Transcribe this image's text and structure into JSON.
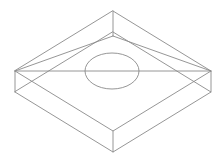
{
  "figure": {
    "background_color": "#ffffff",
    "line_color": "#8a8a8a",
    "line_width": 0.9,
    "canvas": {
      "width": 223,
      "height": 162
    }
  },
  "geometry": {
    "description": "Rectangular plate drawn in isometric projection, wireframe with hidden edges visible, circular hole centered on top face",
    "vertices_top_face": {
      "back": {
        "x": 113,
        "y": 11
      },
      "left": {
        "x": 15,
        "y": 71
      },
      "right": {
        "x": 211,
        "y": 71
      },
      "front": {
        "x": 113,
        "y": 131
      }
    },
    "vertices_bottom_face": {
      "back": {
        "x": 113,
        "y": 32
      },
      "left": {
        "x": 15,
        "y": 92
      },
      "right": {
        "x": 211,
        "y": 92
      },
      "front": {
        "x": 113,
        "y": 152
      }
    },
    "inner_back_vertex": {
      "x": 113,
      "y": 36
    },
    "thickness_px": 21,
    "hole": {
      "center": {
        "x": 112,
        "y": 71
      },
      "radius_x": 27,
      "radius_y": 18
    }
  },
  "edges": {
    "top_face_outline": "113,11 211,71 113,131 15,71 Z",
    "bottom_face_outline": "113,32 211,92 113,152 15,92 Z",
    "vertical_left": "15,71 15,92",
    "vertical_right": "211,71 211,92",
    "vertical_front": "113,131 113,152",
    "vertical_back": "113,11 113,36",
    "hidden_back_left": "15,71 113,36",
    "hidden_back_right": "211,71 113,36",
    "midline_horizontal": "15,71 211,71"
  },
  "labels": {
    "figure_caption": "",
    "dimensions": []
  }
}
